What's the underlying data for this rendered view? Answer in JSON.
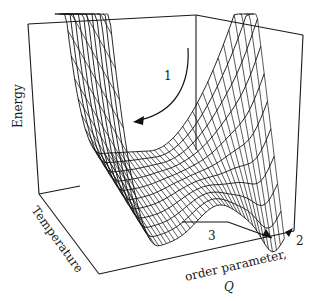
{
  "figure": {
    "type": "3d-surface",
    "axes": {
      "z_label": "Energy",
      "y_label": "Temperature",
      "x_label_line1": "order parameter,",
      "x_label_line2": "Q"
    },
    "annotations": [
      {
        "id": "1",
        "label": "1",
        "note": "curved arrow down the steep wall into the valley"
      },
      {
        "id": "2",
        "label": "2",
        "note": "minimum at large Q, front-right corner"
      },
      {
        "id": "3",
        "label": "3",
        "note": "path along the front edge toward minimum 2"
      }
    ],
    "colors": {
      "ink": "#111111",
      "background": "#ffffff"
    }
  }
}
